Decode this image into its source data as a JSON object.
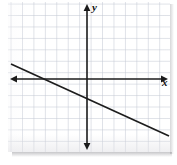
{
  "figure": {
    "name": "coordinate-plane-linear-graph",
    "background_color": "#ffffff",
    "panel": {
      "left": 8,
      "top": 2,
      "width": 162,
      "height": 150,
      "grid_color": "#c4c9d4",
      "grid_spacing_px": 11.45
    },
    "axes": {
      "color": "#1b1b1b",
      "x_label": "x",
      "y_label": "y",
      "origin_px": {
        "x": 79,
        "y": 77
      },
      "x_axis": {
        "start_px": {
          "x": 4,
          "y": 77
        },
        "end_px": {
          "x": 158,
          "y": 77
        },
        "arrow_left": true,
        "arrow_right": true
      },
      "y_axis": {
        "start_px": {
          "x": 79,
          "y": 4
        },
        "end_px": {
          "x": 79,
          "y": 146
        },
        "arrow_up": true,
        "arrow_down": true
      }
    }
  },
  "chart_data": {
    "type": "line",
    "title": "",
    "xlabel": "x",
    "ylabel": "y",
    "grid": true,
    "legend": "none",
    "xlim": [
      -7,
      7
    ],
    "ylim": [
      -6.5,
      6.5
    ],
    "series": [
      {
        "name": "line",
        "color": "#1d1d1d",
        "slope": -0.5,
        "y_intercept": -2,
        "x_intercept": -4,
        "equation": "y = -0.5x - 2",
        "x": [
          -6.6,
          7.3
        ],
        "y": [
          1.3,
          -5.65
        ],
        "endpoints_px": [
          {
            "x": 3,
            "y": 62
          },
          {
            "x": 161,
            "y": 134
          }
        ]
      }
    ]
  }
}
